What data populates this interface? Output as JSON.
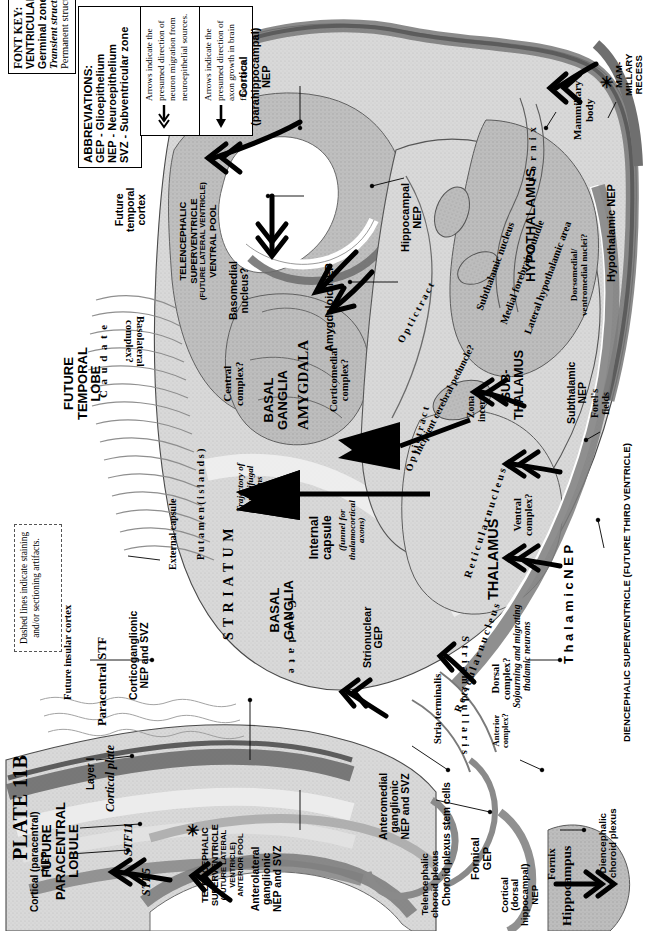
{
  "plate": {
    "number": "PLATE 11B",
    "region_title_lines": [
      "FUTURE",
      "PARACENTRAL",
      "LOBULE"
    ]
  },
  "font_key": {
    "title": "FONT KEY:",
    "lines": [
      "VENTRICULAR DIVISIONS – CAPITALS",
      "Germinal zone - Helvetica bold",
      "Transient structure - Times bold italic",
      "Permanent structure - Times Roman or Bold"
    ]
  },
  "abbreviations": {
    "title": "ABBREVIATIONS:",
    "items": [
      "GEP - Glioepithelium",
      "NEP - Neuroepithelium",
      "SVZ - Subventricular zone"
    ]
  },
  "arrow_keys": [
    {
      "glyph": "double-chevron-arrow",
      "text_runs": [
        "Arrows indicate the presumed ",
        "direction of neuron migration",
        " from neuroepithelial sources."
      ],
      "plain": "Arrows indicate the presumed direction of neuron migration from neuroepithelial sources."
    },
    {
      "glyph": "solid-arrow",
      "text_runs": [
        "Arrows indicate the presumed ",
        "direction of axon growth",
        " in brain fiber tracts."
      ],
      "plain": "Arrows indicate the presumed direction of axon growth in brain fiber tracts."
    }
  ],
  "dashed_note": "Dashed lines indicate staining and/or sectioning artifacts.",
  "ventricular_divisions": [
    {
      "id": "telencephalic-superventricle-ventral",
      "lines": [
        "TELENCEPHALIC",
        "SUPERVENTRICLE",
        "(FUTURE LATERAL VENTRICLE)",
        "VENTRAL POOL"
      ]
    },
    {
      "id": "telencephalic-superventricle-anterior",
      "lines": [
        "TELENCEPHALIC",
        "SUPERVENTRICLE",
        "(FUTURE LATERAL",
        "VENTRICLE)",
        "ANTERIOR POOL"
      ]
    },
    {
      "id": "diencephalic-superventricle",
      "lines": [
        "DIENCEPHALIC SUPERVENTRICLE (FUTURE THIRD VENTRICLE)"
      ]
    },
    {
      "id": "mammillary-recess",
      "lines": [
        "MAM-",
        "MILLARY",
        "RECESS"
      ]
    }
  ],
  "major_structures": [
    {
      "id": "future-temporal-lobe",
      "lines": [
        "FUTURE",
        "TEMPORAL",
        "LOBE"
      ]
    },
    {
      "id": "amygdala",
      "lines": [
        "AMYGDALA"
      ]
    },
    {
      "id": "basal-ganglia-upper",
      "lines": [
        "BASAL",
        "GANGLIA"
      ]
    },
    {
      "id": "basal-ganglia-lower",
      "lines": [
        "BASAL",
        "GANGLIA"
      ]
    },
    {
      "id": "striatum",
      "lines": [
        "S T R I A T U M"
      ]
    },
    {
      "id": "hypothalamus",
      "lines": [
        "HYPOTHALAMUS"
      ]
    },
    {
      "id": "sub-thalamus",
      "lines": [
        "SUB-",
        "THALAMUS"
      ]
    },
    {
      "id": "thalamus",
      "lines": [
        "THALAMUS"
      ]
    },
    {
      "id": "hippocampus",
      "lines": [
        "Hippocampus"
      ]
    }
  ],
  "germinal_zones": [
    {
      "id": "cortical-parahippocampal-nep",
      "lines": [
        "Cortical",
        "(parahippocampal)",
        "NEP"
      ]
    },
    {
      "id": "hippocampal-nep",
      "lines": [
        "Hippocampal",
        "NEP"
      ]
    },
    {
      "id": "amygdaloid-nep",
      "lines": [
        "Amygdaloid NEP"
      ]
    },
    {
      "id": "corticoganglionic-nep-svz",
      "lines": [
        "Corticoganglionic",
        "NEP and SVZ"
      ]
    },
    {
      "id": "cortical-paracentral-nep",
      "lines": [
        "Cortical (paracentral)",
        "NEP"
      ]
    },
    {
      "id": "anterolateral-ganglionic-nep-svz",
      "lines": [
        "Anterolateral",
        "ganglionic",
        "NEP and SVZ"
      ]
    },
    {
      "id": "anteromedial-ganglionic-nep-svz",
      "lines": [
        "Anteromedial",
        "ganglionic",
        "NEP and SVZ"
      ]
    },
    {
      "id": "strionuclear-gep",
      "lines": [
        "Strionuclear",
        "GEP"
      ]
    },
    {
      "id": "fornical-gep",
      "lines": [
        "Fornical",
        "GEP"
      ]
    },
    {
      "id": "cortical-dorsal-hippocampal-nep",
      "lines": [
        "Cortical",
        "(dorsal",
        "hippocampal)",
        "NEP"
      ]
    },
    {
      "id": "choroid-plexus-stem-cells",
      "lines": [
        "Choroid plexus stem cells"
      ]
    },
    {
      "id": "thalamic-nep",
      "lines": [
        "T h a l a m i c   N E P"
      ]
    },
    {
      "id": "subthalamic-nep",
      "lines": [
        "Subthalamic",
        "NEP"
      ]
    },
    {
      "id": "hypothalamic-nep",
      "lines": [
        "Hypothalamic NEP"
      ]
    }
  ],
  "transient_structures": [
    {
      "id": "cortical-plate",
      "lines": [
        "Cortical plate"
      ]
    },
    {
      "id": "stf11",
      "lines": [
        "STF11"
      ]
    },
    {
      "id": "stf5",
      "lines": [
        "STF5"
      ]
    },
    {
      "id": "paracentral-stf",
      "lines": [
        "Paracentral STF"
      ]
    },
    {
      "id": "trajectory-corticifugal-axons",
      "lines": [
        "Trajectory of",
        "corticifugal",
        "axons"
      ]
    },
    {
      "id": "internal-capsule-funnel",
      "lines": [
        "(funnel for",
        "thalamocortical",
        "axons)"
      ]
    },
    {
      "id": "sojourning-migrating-thalamic-neurons",
      "lines": [
        "Sojourning and migrating",
        "thalamic neurons"
      ]
    }
  ],
  "permanent_structures": [
    {
      "id": "layer-i",
      "lines": [
        "Layer I"
      ]
    },
    {
      "id": "future-insular-cortex",
      "lines": [
        "Future insular cortex"
      ]
    },
    {
      "id": "future-temporal-cortex",
      "lines": [
        "Future",
        "temporal",
        "cortex"
      ]
    },
    {
      "id": "caudate-upper",
      "lines": [
        "C a u d a t e"
      ]
    },
    {
      "id": "caudate-lower",
      "lines": [
        "C a u d a t e"
      ]
    },
    {
      "id": "putamen-islands",
      "lines": [
        "P u t a m e n  ( i s l a n d s )"
      ]
    },
    {
      "id": "external-capsule",
      "lines": [
        "External capsule"
      ]
    },
    {
      "id": "internal-capsule",
      "lines": [
        "Internal",
        "capsule"
      ]
    },
    {
      "id": "basolateral-complex",
      "lines": [
        "Basolateral",
        "complex?"
      ]
    },
    {
      "id": "basomedial-nucleus",
      "lines": [
        "Basomedial",
        "nucleus?"
      ]
    },
    {
      "id": "central-complex",
      "lines": [
        "Central",
        "complex?"
      ]
    },
    {
      "id": "corticomedial-complex",
      "lines": [
        "Corticomedial",
        "complex?"
      ]
    },
    {
      "id": "optic-tract-upper",
      "lines": [
        "O p t i c   t r a c t"
      ]
    },
    {
      "id": "optic-tract-lower",
      "lines": [
        "O p t i c   t r a c t"
      ]
    },
    {
      "id": "incipient-cerebral-peduncle",
      "lines": [
        "Incipient cerebral peduncle?"
      ]
    },
    {
      "id": "subthalamic-nucleus",
      "lines": [
        "Subthalamic nucleus"
      ]
    },
    {
      "id": "medial-forebrain-bundle",
      "lines": [
        "Medial forebrain bundle"
      ]
    },
    {
      "id": "lateral-hypothalamic-area",
      "lines": [
        "Lateral hypothalamic area"
      ]
    },
    {
      "id": "zona-incerta",
      "lines": [
        "Zona",
        "incerta"
      ]
    },
    {
      "id": "forels-fields",
      "lines": [
        "Forel's",
        "fields"
      ]
    },
    {
      "id": "fornix-upper",
      "lines": [
        "F o r n i x"
      ]
    },
    {
      "id": "fornix-lower",
      "lines": [
        "Fornix"
      ]
    },
    {
      "id": "mammillary-body",
      "lines": [
        "Mammillary",
        "body"
      ]
    },
    {
      "id": "dorsomedial-ventromedial-nuclei",
      "lines": [
        "Dorsomedial/",
        "ventromedial nuclei?"
      ]
    },
    {
      "id": "reticular-nucleus-upper",
      "lines": [
        "R e t i c u l a r   n u c l e u s"
      ]
    },
    {
      "id": "reticular-nucleus-lower",
      "lines": [
        "R e t i c u l a r   n u c l e u s"
      ]
    },
    {
      "id": "ventral-complex",
      "lines": [
        "Ventral",
        "complex?"
      ]
    },
    {
      "id": "dorsal-complex",
      "lines": [
        "Dorsal",
        "complex?"
      ]
    },
    {
      "id": "anterior-complex",
      "lines": [
        "Anterior",
        "complex?"
      ]
    },
    {
      "id": "stria-terminalis",
      "lines": [
        "Stria terminalis"
      ]
    },
    {
      "id": "stria-medullaris",
      "lines": [
        "S t r i a  m e d u l l a r i s"
      ]
    },
    {
      "id": "telencephalic-choroid-plexus",
      "lines": [
        "Telencephalic",
        "choroid plexus"
      ]
    },
    {
      "id": "diencephalic-choroid-plexus",
      "lines": [
        "Diencephalic",
        "choroid plexus"
      ]
    }
  ],
  "colors": {
    "tissue_light": "#dcdcdc",
    "tissue_mid": "#b8b8b8",
    "tissue_dark": "#8e8e8e",
    "tissue_darker": "#6f6f6f",
    "ink": "#000000",
    "ventricle": "#ffffff",
    "outline": "#3a3a3a"
  }
}
